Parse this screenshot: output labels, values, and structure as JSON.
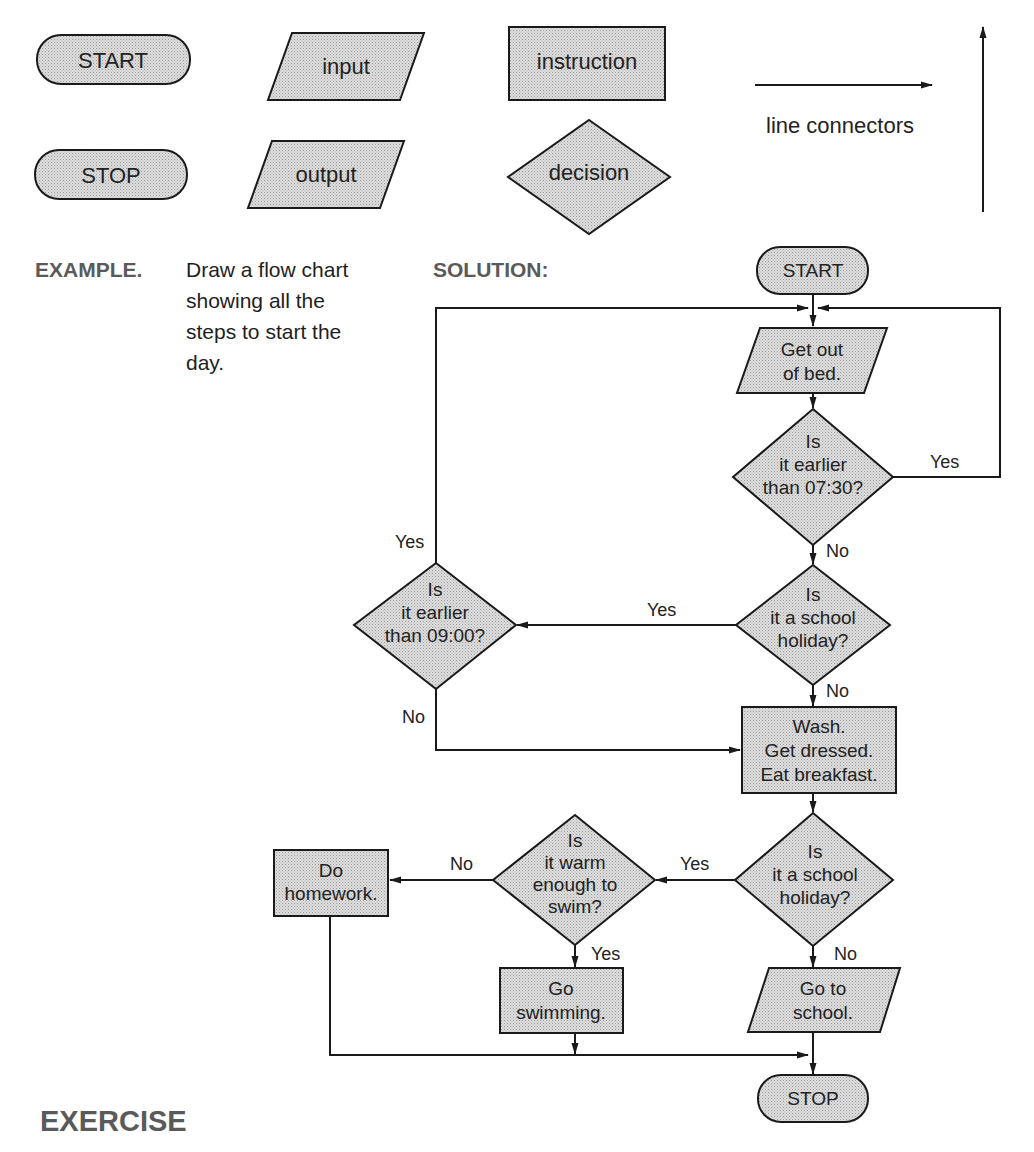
{
  "legend": {
    "start_label": "START",
    "stop_label": "STOP",
    "input_label": "input",
    "output_label": "output",
    "instruction_label": "instruction",
    "decision_label": "decision",
    "connectors_label": "line connectors"
  },
  "example": {
    "heading": "EXAMPLE.",
    "lines": [
      "Draw a flow chart",
      "showing all the",
      "steps to start the",
      "day."
    ],
    "solution_heading": "SOLUTION:"
  },
  "flowchart": {
    "start": "START",
    "get_out_of_bed": [
      "Get out",
      "of bed."
    ],
    "earlier_0730": [
      "Is",
      "it earlier",
      "than 07:30?"
    ],
    "school_holiday_1": [
      "Is",
      "it a school",
      "holiday?"
    ],
    "earlier_0900": [
      "Is",
      "it earlier",
      "than 09:00?"
    ],
    "wash_dress_eat": [
      "Wash.",
      "Get dressed.",
      "Eat breakfast."
    ],
    "school_holiday_2": [
      "Is",
      "it a school",
      "holiday?"
    ],
    "warm_to_swim": [
      "Is",
      "it warm",
      "enough to",
      "swim?"
    ],
    "do_homework": [
      "Do",
      "homework."
    ],
    "go_swimming": [
      "Go",
      "swimming."
    ],
    "go_to_school": [
      "Go to",
      "school."
    ],
    "stop": "STOP",
    "edge_labels": {
      "yes_0730": "Yes",
      "no_0730": "No",
      "yes_holiday1": "Yes",
      "no_holiday1": "No",
      "yes_0900": "Yes",
      "no_0900": "No",
      "yes_holiday2": "Yes",
      "no_holiday2": "No",
      "no_swim": "No",
      "yes_swim": "Yes"
    }
  },
  "exercise": {
    "heading": "EXERCISE"
  },
  "colors": {
    "shape_fill": "#d2d2d2",
    "stroke": "#1a1a1a",
    "heading": "#5a5a5a"
  }
}
